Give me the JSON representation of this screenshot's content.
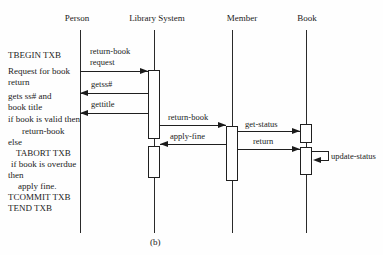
{
  "diagram": {
    "type": "uml-sequence-diagram",
    "caption": "(b)",
    "ink_color": "#1a1a1a",
    "background_color": "#fefefe",
    "actors": [
      {
        "id": "person",
        "label": "Person",
        "line_x": 80,
        "label_cx": 77
      },
      {
        "id": "library-system",
        "label": "Library System",
        "line_x": 154,
        "label_cx": 157
      },
      {
        "id": "member",
        "label": "Member",
        "line_x": 232,
        "label_cx": 242
      },
      {
        "id": "book",
        "label": "Book",
        "line_x": 306,
        "label_cx": 307
      }
    ],
    "lifeline": {
      "top": 30,
      "bottom": 233,
      "label_top": 13
    },
    "activations": [
      {
        "actor": "library-system",
        "x": 148,
        "y": 70,
        "w": 12,
        "h": 69
      },
      {
        "actor": "library-system",
        "x": 148,
        "y": 146,
        "w": 12,
        "h": 32
      },
      {
        "actor": "member",
        "x": 226,
        "y": 126,
        "w": 12,
        "h": 55
      },
      {
        "actor": "book",
        "x": 300,
        "y": 124,
        "w": 12,
        "h": 19
      },
      {
        "actor": "book",
        "x": 300,
        "y": 147,
        "w": 12,
        "h": 28
      }
    ],
    "messages": [
      {
        "id": "request",
        "label_lines": [
          "return-book",
          "request"
        ],
        "label_x": 90,
        "label_y": 46,
        "y": 71,
        "x1": 80,
        "x2": 148,
        "dir": "right"
      },
      {
        "id": "getss",
        "label_lines": [
          "getss#"
        ],
        "label_x": 91,
        "label_y": 79,
        "y": 93,
        "x1": 80,
        "x2": 148,
        "dir": "left"
      },
      {
        "id": "gettitle",
        "label_lines": [
          "gettitle"
        ],
        "label_x": 91,
        "label_y": 99,
        "y": 113,
        "x1": 80,
        "x2": 148,
        "dir": "left"
      },
      {
        "id": "return-book",
        "label_lines": [
          "return-book"
        ],
        "label_x": 168,
        "label_y": 112,
        "y": 125,
        "x1": 160,
        "x2": 226,
        "dir": "right"
      },
      {
        "id": "get-status",
        "label_lines": [
          "get-status"
        ],
        "label_x": 245,
        "label_y": 119,
        "y": 131,
        "x1": 238,
        "x2": 300,
        "dir": "right"
      },
      {
        "id": "apply-fine",
        "label_lines": [
          "apply-fine"
        ],
        "label_x": 170,
        "label_y": 131,
        "y": 144,
        "x1": 160,
        "x2": 226,
        "dir": "left"
      },
      {
        "id": "return",
        "label_lines": [
          "return"
        ],
        "label_x": 253,
        "label_y": 136,
        "y": 149,
        "x1": 238,
        "x2": 300,
        "dir": "right"
      }
    ],
    "self_message": {
      "id": "update-status",
      "label": "update-status",
      "label_x": 331,
      "label_y": 151,
      "x_start": 312,
      "x_right": 328,
      "y_top": 151,
      "y_bottom": 160,
      "arrow_x": 313
    },
    "pseudocode": {
      "x": 8,
      "lines": [
        {
          "text": "TBEGIN TXB",
          "y": 50,
          "indent": 0
        },
        {
          "text": "Request for book",
          "y": 66,
          "indent": 0
        },
        {
          "text": "return",
          "y": 77,
          "indent": 0
        },
        {
          "text": "gets ss# and",
          "y": 91,
          "indent": 0
        },
        {
          "text": "book title",
          "y": 102,
          "indent": 0
        },
        {
          "text": "if book is valid then",
          "y": 114,
          "indent": 0
        },
        {
          "text": "return-book",
          "y": 126,
          "indent": 14
        },
        {
          "text": "else",
          "y": 137,
          "indent": 0
        },
        {
          "text": "TABORT TXB",
          "y": 148,
          "indent": 8
        },
        {
          "text": "if book is overdue",
          "y": 159,
          "indent": 3
        },
        {
          "text": "then",
          "y": 170,
          "indent": 0
        },
        {
          "text": "apply fine.",
          "y": 181,
          "indent": 10
        },
        {
          "text": "TCOMMIT TXB",
          "y": 192,
          "indent": 0
        },
        {
          "text": "TEND TXB",
          "y": 203,
          "indent": 0
        }
      ]
    },
    "caption_pos": {
      "x": 150,
      "y": 237
    }
  }
}
